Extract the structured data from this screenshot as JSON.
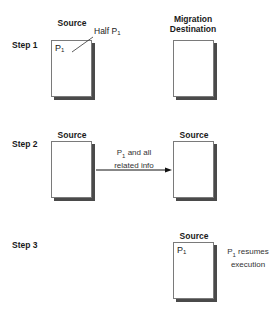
{
  "steps": [
    {
      "label": "Step 1",
      "source": {
        "header": "Source",
        "process": "P",
        "process_sub": "1"
      },
      "destination": {
        "header_line1": "Migration",
        "header_line2": "Destination"
      },
      "annotation": {
        "text": "Half P",
        "sub": "1"
      }
    },
    {
      "label": "Step 2",
      "source": {
        "header": "Source"
      },
      "destination": {
        "header": "Source"
      },
      "arrow": {
        "line1_main": "P",
        "line1_sub": "1",
        "line1_rest": " and all",
        "line2": "related info"
      }
    },
    {
      "label": "Step 3",
      "destination": {
        "header": "Source",
        "process": "P",
        "process_sub": "1"
      },
      "annotation": {
        "line1_main": "P",
        "line1_sub": "1",
        "line1_rest": " resumes",
        "line2": "execution"
      }
    }
  ],
  "colors": {
    "box_border": "#7a7a7a",
    "shadow": "#4a4a4a",
    "text": "#1a1a1a"
  }
}
